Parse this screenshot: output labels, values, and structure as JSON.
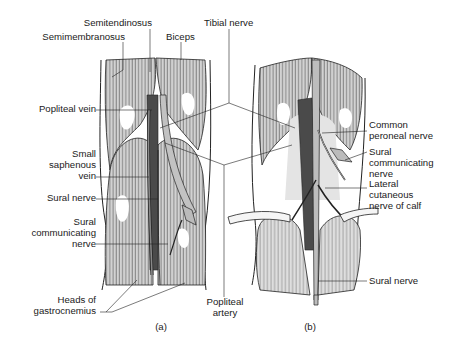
{
  "figure": {
    "panels": [
      {
        "id": "a",
        "caption": "(a)",
        "labels": [
          {
            "key": "semitendinosus",
            "lines": [
              "Semitendinosus"
            ]
          },
          {
            "key": "semimembranosus",
            "lines": [
              "Semimembranosus"
            ]
          },
          {
            "key": "biceps",
            "lines": [
              "Biceps"
            ]
          },
          {
            "key": "popliteal_vein",
            "lines": [
              "Popliteal vein"
            ]
          },
          {
            "key": "small_saphenous_vein",
            "lines": [
              "Small",
              "saphenous",
              "vein"
            ]
          },
          {
            "key": "sural_nerve",
            "lines": [
              "Sural nerve"
            ]
          },
          {
            "key": "sural_communicating_nerve",
            "lines": [
              "Sural",
              "communicating",
              "nerve"
            ]
          },
          {
            "key": "heads_of_gastrocnemius",
            "lines": [
              "Heads of",
              "gastrocnemius"
            ]
          }
        ]
      },
      {
        "id": "b",
        "caption": "(b)",
        "labels": [
          {
            "key": "common_peroneal_nerve",
            "lines": [
              "Common",
              "peroneal nerve"
            ]
          },
          {
            "key": "sural_communicating_nerve",
            "lines": [
              "Sural",
              "communicating",
              "nerve"
            ]
          },
          {
            "key": "lateral_cutaneous_nerve_of_calf",
            "lines": [
              "Lateral",
              "cutaneous",
              "nerve of calf"
            ]
          },
          {
            "key": "sural_nerve",
            "lines": [
              "Sural nerve"
            ]
          }
        ]
      }
    ],
    "shared_labels": [
      {
        "key": "tibial_nerve",
        "lines": [
          "Tibial nerve"
        ]
      },
      {
        "key": "popliteal_artery",
        "lines": [
          "Popliteal",
          "artery"
        ]
      }
    ]
  },
  "labels": {
    "semitendinosus": "Semitendinosus",
    "semimembranosus": "Semimembranosus",
    "biceps": "Biceps",
    "tibial_nerve": "Tibial nerve",
    "popliteal_vein": "Popliteal vein",
    "small_saphenous_vein_1": "Small",
    "small_saphenous_vein_2": "saphenous",
    "small_saphenous_vein_3": "vein",
    "sural_nerve_a": "Sural nerve",
    "sural_comm_a_1": "Sural",
    "sural_comm_a_2": "communicating",
    "sural_comm_a_3": "nerve",
    "heads_gastro_1": "Heads of",
    "heads_gastro_2": "gastrocnemius",
    "popliteal_artery_1": "Popliteal",
    "popliteal_artery_2": "artery",
    "common_peroneal_1": "Common",
    "common_peroneal_2": "peroneal nerve",
    "sural_comm_b_1": "Sural",
    "sural_comm_b_2": "communicating",
    "sural_comm_b_3": "nerve",
    "lat_cut_1": "Lateral",
    "lat_cut_2": "cutaneous",
    "lat_cut_3": "nerve of calf",
    "sural_nerve_b": "Sural nerve",
    "caption_a": "(a)",
    "caption_b": "(b)"
  },
  "colors": {
    "background": "#ffffff",
    "ink": "#1a1a1a",
    "muscle_fill": "#c9c9c9",
    "muscle_light": "#e4e4e4",
    "vessel_dark": "#4a4a4a",
    "nerve_fill": "#bdbdbd"
  }
}
